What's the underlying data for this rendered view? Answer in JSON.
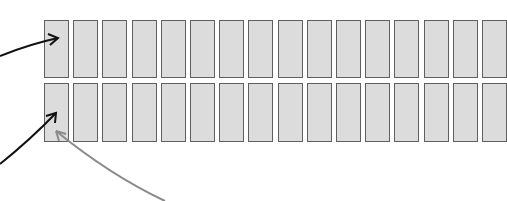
{
  "diagram": {
    "rows": [
      {
        "name": "top-row",
        "top": 20,
        "height": 56,
        "cell_count": 16
      },
      {
        "name": "bottom-row",
        "top": 83,
        "height": 57,
        "cell_count": 16
      }
    ],
    "cell": {
      "first_left": 44,
      "pitch": 29.2,
      "width": 23,
      "fill": "#dcdcdc",
      "stroke": "#5f5f5f"
    },
    "arrows": [
      {
        "name": "black-arrow-top",
        "color": "#111111",
        "from": [
          0,
          56
        ],
        "to": [
          58,
          38
        ],
        "target": "top-row cell 1"
      },
      {
        "name": "black-arrow-bottom",
        "color": "#111111",
        "from": [
          0,
          164
        ],
        "to": [
          57,
          113
        ],
        "target": "bottom-row cell 1"
      },
      {
        "name": "gray-arrow-bottom",
        "color": "#8a8a8a",
        "from": [
          165,
          201
        ],
        "to": [
          55,
          130
        ],
        "target": "bottom-row cell 1"
      }
    ]
  }
}
